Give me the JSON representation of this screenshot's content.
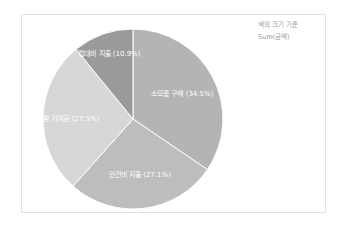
{
  "legend": {
    "line1": "색의 크기 기준",
    "line2": "Sum(금액)"
  },
  "chart_data": {
    "type": "pie",
    "title": "",
    "size_by": "Sum(금액)",
    "start_angle": "12 o'clock, clockwise",
    "categories": [
      "소모품 구매",
      "인건비 지출",
      "순환 기여금",
      "접대비 지출"
    ],
    "values": [
      34.5,
      27.1,
      27.5,
      10.9
    ],
    "unit": "%",
    "labels": [
      "소모품 구매 (34.5%)",
      "인건비 지출 (27.1%)",
      "순환 기여금 (27.5%)",
      "접대비 지출 (10.9%)"
    ],
    "colors": [
      "#b4b4b4",
      "#bdbdbd",
      "#d7d7d7",
      "#9a9a9a"
    ],
    "legend_position": "top-right"
  }
}
